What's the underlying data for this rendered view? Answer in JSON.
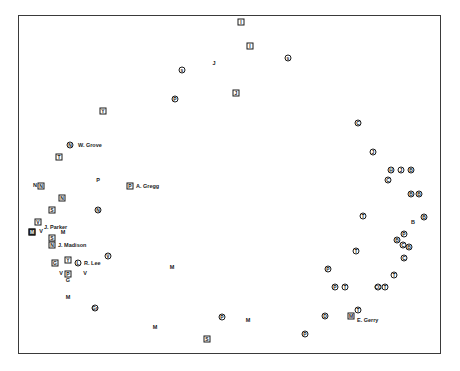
{
  "diagram": {
    "type": "scatter",
    "frame": {
      "left": 18,
      "top": 15,
      "right": 441,
      "bottom": 354
    },
    "points": [
      {
        "x": 241,
        "y": 22,
        "shape": "square",
        "glyph": "I"
      },
      {
        "x": 250,
        "y": 46,
        "shape": "square",
        "glyph": "I"
      },
      {
        "x": 288,
        "y": 58,
        "shape": "circle",
        "glyph": "s"
      },
      {
        "x": 182,
        "y": 70,
        "shape": "circle",
        "glyph": "s"
      },
      {
        "x": 214,
        "y": 64,
        "shape": "plain",
        "glyph": "J"
      },
      {
        "x": 175,
        "y": 99,
        "shape": "circle",
        "glyph": "P"
      },
      {
        "x": 236,
        "y": 93,
        "shape": "square",
        "glyph": "J"
      },
      {
        "x": 103,
        "y": 111,
        "shape": "square",
        "glyph": "Y"
      },
      {
        "x": 358,
        "y": 123,
        "shape": "circle",
        "glyph": "C"
      },
      {
        "x": 373,
        "y": 152,
        "shape": "circle",
        "glyph": "J"
      },
      {
        "x": 391,
        "y": 170,
        "shape": "circle",
        "glyph": "H"
      },
      {
        "x": 401,
        "y": 170,
        "shape": "circle",
        "glyph": "J"
      },
      {
        "x": 411,
        "y": 170,
        "shape": "circle",
        "glyph": "B"
      },
      {
        "x": 388,
        "y": 180,
        "shape": "circle",
        "glyph": "C"
      },
      {
        "x": 70,
        "y": 145,
        "shape": "circle",
        "glyph": "N"
      },
      {
        "x": 59,
        "y": 157,
        "shape": "square",
        "glyph": "T"
      },
      {
        "x": 98,
        "y": 181,
        "shape": "plain",
        "glyph": "P"
      },
      {
        "x": 130,
        "y": 186,
        "shape": "square",
        "glyph": "P"
      },
      {
        "x": 41,
        "y": 186,
        "shape": "square",
        "glyph": "N"
      },
      {
        "x": 35,
        "y": 186,
        "shape": "plain",
        "glyph": "N"
      },
      {
        "x": 62,
        "y": 198,
        "shape": "square",
        "glyph": "N"
      },
      {
        "x": 52,
        "y": 210,
        "shape": "square",
        "glyph": "S"
      },
      {
        "x": 98,
        "y": 210,
        "shape": "circle",
        "glyph": "N"
      },
      {
        "x": 38,
        "y": 222,
        "shape": "square",
        "glyph": "V"
      },
      {
        "x": 32,
        "y": 232,
        "shape": "square",
        "glyph": "M",
        "filled": true
      },
      {
        "x": 41,
        "y": 232,
        "shape": "plain",
        "glyph": "V"
      },
      {
        "x": 63,
        "y": 233,
        "shape": "plain",
        "glyph": "M"
      },
      {
        "x": 52,
        "y": 238,
        "shape": "square",
        "glyph": "S"
      },
      {
        "x": 52,
        "y": 245,
        "shape": "square",
        "glyph": "N"
      },
      {
        "x": 68,
        "y": 260,
        "shape": "square",
        "glyph": "Y"
      },
      {
        "x": 78,
        "y": 263,
        "shape": "circle",
        "glyph": "L"
      },
      {
        "x": 108,
        "y": 256,
        "shape": "circle",
        "glyph": "V"
      },
      {
        "x": 55,
        "y": 263,
        "shape": "square",
        "glyph": "G"
      },
      {
        "x": 68,
        "y": 274,
        "shape": "square",
        "glyph": "P"
      },
      {
        "x": 61,
        "y": 274,
        "shape": "plain",
        "glyph": "V"
      },
      {
        "x": 68,
        "y": 281,
        "shape": "plain",
        "glyph": "G"
      },
      {
        "x": 85,
        "y": 274,
        "shape": "plain",
        "glyph": "V"
      },
      {
        "x": 68,
        "y": 298,
        "shape": "plain",
        "glyph": "M"
      },
      {
        "x": 95,
        "y": 308,
        "shape": "circle",
        "glyph": "Gr"
      },
      {
        "x": 172,
        "y": 268,
        "shape": "plain",
        "glyph": "M"
      },
      {
        "x": 155,
        "y": 328,
        "shape": "plain",
        "glyph": "M"
      },
      {
        "x": 222,
        "y": 317,
        "shape": "circle",
        "glyph": "P"
      },
      {
        "x": 248,
        "y": 321,
        "shape": "plain",
        "glyph": "M"
      },
      {
        "x": 207,
        "y": 339,
        "shape": "square",
        "glyph": "S"
      },
      {
        "x": 411,
        "y": 194,
        "shape": "circle",
        "glyph": "B"
      },
      {
        "x": 419,
        "y": 194,
        "shape": "circle",
        "glyph": "B"
      },
      {
        "x": 363,
        "y": 216,
        "shape": "circle",
        "glyph": "T"
      },
      {
        "x": 413,
        "y": 223,
        "shape": "plain",
        "glyph": "B"
      },
      {
        "x": 424,
        "y": 217,
        "shape": "circle",
        "glyph": "B"
      },
      {
        "x": 404,
        "y": 234,
        "shape": "circle",
        "glyph": "P"
      },
      {
        "x": 397,
        "y": 240,
        "shape": "circle",
        "glyph": "B"
      },
      {
        "x": 403,
        "y": 245,
        "shape": "circle",
        "glyph": "C"
      },
      {
        "x": 409,
        "y": 247,
        "shape": "circle",
        "glyph": "B"
      },
      {
        "x": 404,
        "y": 258,
        "shape": "circle",
        "glyph": "C"
      },
      {
        "x": 356,
        "y": 251,
        "shape": "circle",
        "glyph": "T"
      },
      {
        "x": 328,
        "y": 269,
        "shape": "circle",
        "glyph": "P"
      },
      {
        "x": 394,
        "y": 275,
        "shape": "circle",
        "glyph": "T"
      },
      {
        "x": 335,
        "y": 287,
        "shape": "circle",
        "glyph": "P"
      },
      {
        "x": 345,
        "y": 287,
        "shape": "circle",
        "glyph": "T"
      },
      {
        "x": 378,
        "y": 287,
        "shape": "circle",
        "glyph": "CC"
      },
      {
        "x": 385,
        "y": 287,
        "shape": "circle",
        "glyph": "T"
      },
      {
        "x": 325,
        "y": 316,
        "shape": "circle",
        "glyph": "D"
      },
      {
        "x": 358,
        "y": 310,
        "shape": "circle",
        "glyph": "T"
      },
      {
        "x": 351,
        "y": 316,
        "shape": "square",
        "glyph": "M"
      },
      {
        "x": 305,
        "y": 334,
        "shape": "circle",
        "glyph": "P"
      }
    ],
    "labels": [
      {
        "x": 78,
        "y": 145,
        "text": "W. Grove"
      },
      {
        "x": 136,
        "y": 186,
        "text": "A. Gregg"
      },
      {
        "x": 44,
        "y": 227,
        "text": "J. Parker"
      },
      {
        "x": 58,
        "y": 245,
        "text": "J. Madison"
      },
      {
        "x": 84,
        "y": 263,
        "text": "R. Lee"
      },
      {
        "x": 357,
        "y": 320,
        "text": "E. Gerry"
      }
    ]
  }
}
